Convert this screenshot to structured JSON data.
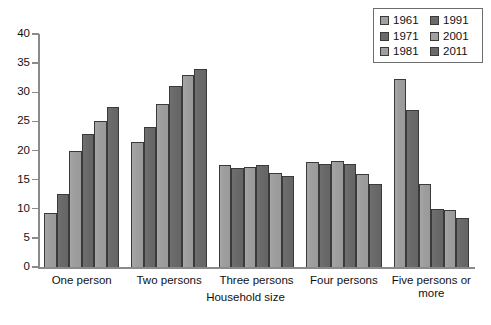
{
  "chart_data": {
    "type": "bar",
    "title": "",
    "xlabel": "Household size",
    "ylabel": "",
    "ylim": [
      0,
      40
    ],
    "yticks": [
      0,
      5,
      10,
      15,
      20,
      25,
      30,
      35,
      40
    ],
    "grid": false,
    "legend_position": "top-right",
    "categories": [
      "One person",
      "Two persons",
      "Three persons",
      "Four persons",
      "Five persons or more"
    ],
    "series": [
      {
        "name": "1961",
        "shade": "light",
        "color": "#a0a0a0",
        "values": [
          9.3,
          21.5,
          17.5,
          18.0,
          32.2
        ]
      },
      {
        "name": "1971",
        "shade": "dark",
        "color": "#6a6a6a",
        "values": [
          12.5,
          24.0,
          17.0,
          17.6,
          27.0
        ]
      },
      {
        "name": "1981",
        "shade": "light",
        "color": "#a0a0a0",
        "values": [
          20.0,
          28.0,
          17.2,
          18.2,
          14.2
        ]
      },
      {
        "name": "1991",
        "shade": "dark",
        "color": "#6a6a6a",
        "values": [
          22.8,
          31.0,
          17.5,
          17.6,
          10.0
        ]
      },
      {
        "name": "2001",
        "shade": "light",
        "color": "#a0a0a0",
        "values": [
          25.0,
          33.0,
          16.2,
          16.0,
          9.8
        ]
      },
      {
        "name": "2011",
        "shade": "dark",
        "color": "#6a6a6a",
        "values": [
          27.5,
          34.0,
          15.6,
          14.2,
          8.5
        ]
      }
    ]
  },
  "legend": {
    "entries": [
      "1961",
      "1991",
      "1971",
      "2001",
      "1981",
      "2011"
    ]
  },
  "axis": {
    "x_title": "Household size"
  }
}
